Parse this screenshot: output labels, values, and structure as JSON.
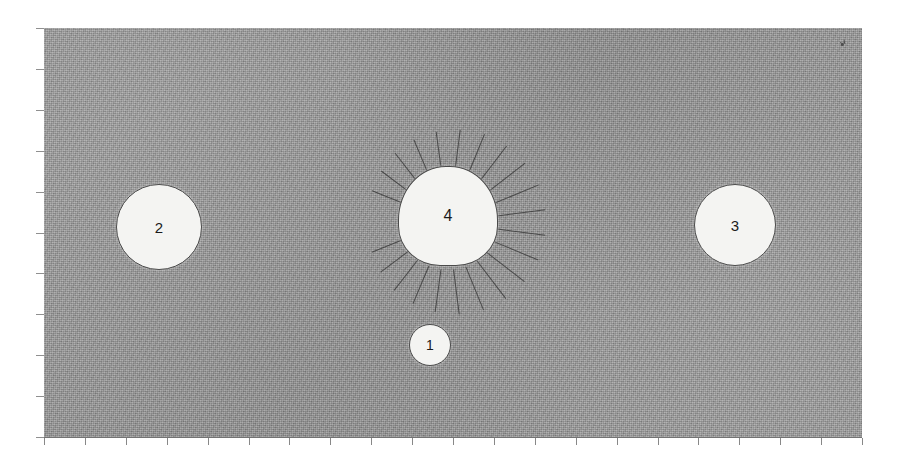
{
  "figure": {
    "background_color": "#ffffff",
    "field_color": "#9b9b9b",
    "outline_color": "#4a4a4a",
    "blob_fill_color": "#f4f4f2",
    "axis_color": "#5b5b5b",
    "field": {
      "x": 44,
      "y": 28,
      "width": 818,
      "height": 409
    }
  },
  "features": [
    {
      "id": "1",
      "label": "1",
      "shape": "circle",
      "has_rays": false,
      "center_x": 430,
      "center_y": 345,
      "diameter": 42
    },
    {
      "id": "2",
      "label": "2",
      "shape": "circle",
      "has_rays": false,
      "center_x": 159,
      "center_y": 227,
      "diameter": 86
    },
    {
      "id": "3",
      "label": "3",
      "shape": "circle",
      "has_rays": false,
      "center_x": 735,
      "center_y": 225,
      "diameter": 82
    },
    {
      "id": "4",
      "label": "4",
      "shape": "dome",
      "has_rays": true,
      "center_x": 448,
      "center_y": 216,
      "diameter": 100,
      "ray_count": 22
    }
  ],
  "axes": {
    "x_tick_count": 20,
    "y_tick_count": 10,
    "x_axis_visible": true,
    "y_axis_visible": false
  },
  "artifact": {
    "name": "scan-artifact",
    "x": 838,
    "y": 38,
    "description": "small dark speck near top-right of field"
  },
  "chart_data": {
    "type": "scatter",
    "xlabel": "",
    "ylabel": "",
    "grid": false,
    "legend": "none",
    "xlim": [
      0,
      20
    ],
    "ylim": [
      0,
      10
    ],
    "categories": [
      "1",
      "2",
      "3",
      "4"
    ],
    "series": [
      {
        "name": "features",
        "points": [
          {
            "label": "1",
            "x": 9.4,
            "y": 2.2,
            "size": 42,
            "rays": 0
          },
          {
            "label": "2",
            "x": 2.8,
            "y": 5.1,
            "size": 86,
            "rays": 0
          },
          {
            "label": "3",
            "x": 16.9,
            "y": 5.2,
            "size": 82,
            "rays": 0
          },
          {
            "label": "4",
            "x": 9.9,
            "y": 5.4,
            "size": 100,
            "rays": 22
          }
        ]
      }
    ]
  }
}
